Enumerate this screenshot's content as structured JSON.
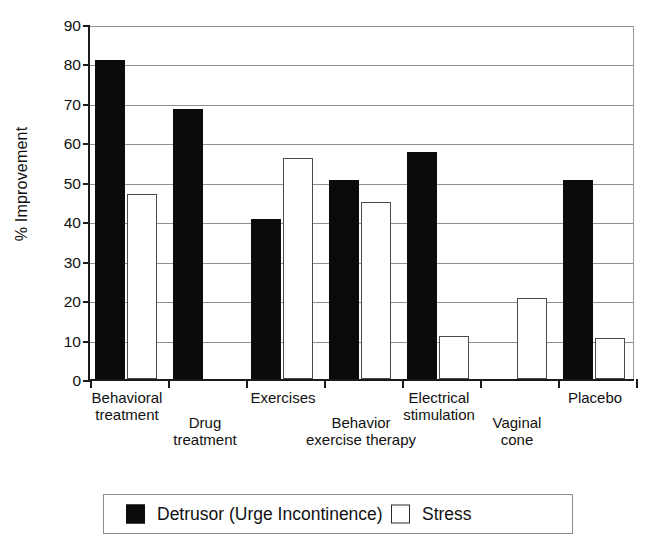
{
  "chart_data": {
    "type": "bar",
    "title": "",
    "xlabel": "",
    "ylabel": "% Improvement",
    "ylim": [
      0,
      90
    ],
    "ytick_step": 10,
    "yticks": [
      0,
      10,
      20,
      30,
      40,
      50,
      60,
      70,
      80,
      90
    ],
    "grid": true,
    "legend_position": "bottom",
    "categories": [
      "Behavioral\ntreatment",
      "Drug\ntreatment",
      "Exercises",
      "Behavior\nexercise therapy",
      "Electrical\nstimulation",
      "Vaginal\ncone",
      "Placebo"
    ],
    "series": [
      {
        "name": "Detrusor (Urge Incontinence)",
        "color": "#0b0b0b",
        "values": [
          81,
          68.5,
          40.5,
          50.5,
          57.5,
          null,
          50.5
        ]
      },
      {
        "name": "Stress",
        "color": "#ffffff",
        "values": [
          47,
          null,
          56,
          45,
          11,
          20.5,
          10.5
        ]
      }
    ]
  },
  "legend": {
    "entries": [
      {
        "label": "Detrusor (Urge Incontinence)",
        "swatch": "black"
      },
      {
        "label": "Stress",
        "swatch": "white"
      }
    ]
  },
  "axis": {
    "y_title": "% Improvement"
  }
}
